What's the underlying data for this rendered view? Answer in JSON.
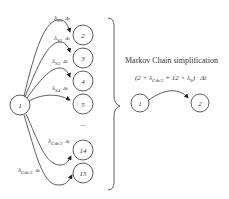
{
  "diagram": {
    "left": {
      "source_node": "1",
      "targets": [
        {
          "node": "2",
          "rate": "λ",
          "sub": "S1",
          "dt": "Δt"
        },
        {
          "node": "3",
          "rate": "λ",
          "sub": "S2",
          "dt": "Δt"
        },
        {
          "node": "4",
          "rate": "λ",
          "sub": "S3",
          "dt": "Δt"
        },
        {
          "node": "5",
          "rate": "λ",
          "sub": "S4",
          "dt": "Δt"
        },
        {
          "node": "14",
          "rate": "λ",
          "sub": "Cdr/2",
          "dt": "Δt"
        },
        {
          "node": "15",
          "rate": "λ",
          "sub": "Cdr/2",
          "dt": "Δt"
        }
      ],
      "ellipsis": "..."
    },
    "right": {
      "title": "Markov Chain simplification",
      "formula": {
        "open": "(2 × ",
        "lambda1": "λ",
        "sub1": "Cdr/2",
        "mid": " + 12 × ",
        "lambda2": "λ",
        "sub2": "S",
        "close": ") · Δt"
      },
      "from_node": "1",
      "to_node": "2"
    }
  }
}
